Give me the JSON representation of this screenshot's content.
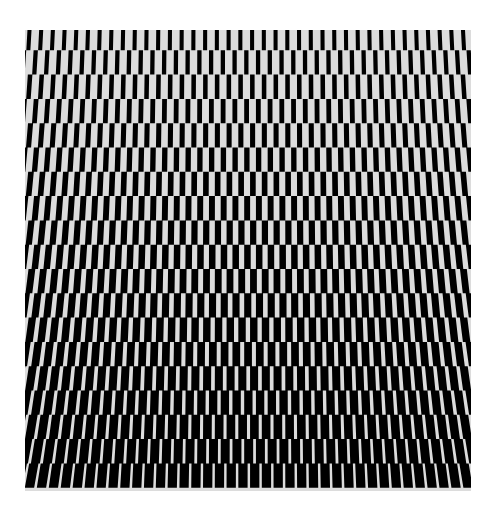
{
  "artwork": {
    "type": "op-art",
    "description": "Black and light-gray staggered bar pattern; bars thicken from top to bottom and slant outward toward edges",
    "colors": {
      "background": "#dcdcdc",
      "bars": "#000000",
      "page": "#ffffff"
    },
    "frame": {
      "x": 25,
      "y": 30,
      "width": 446,
      "height": 461
    },
    "grid": {
      "columns": 38,
      "rows": 19,
      "period_px": 11.74,
      "row_height_px": 24.3,
      "bar_width_top_px": 4,
      "bar_width_bottom_px": 9.5,
      "max_slant_px": 4.5
    }
  }
}
